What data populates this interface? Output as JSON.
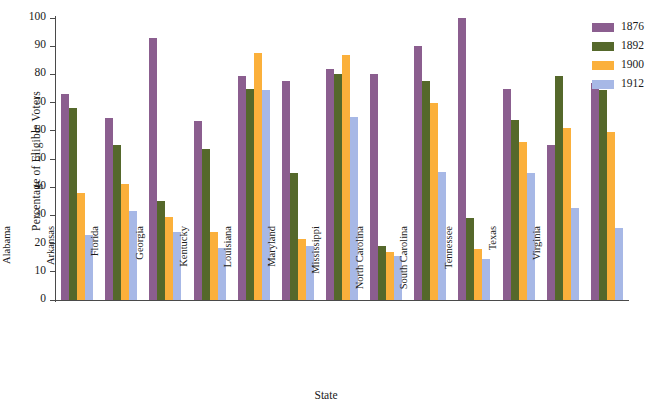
{
  "chart_data": {
    "type": "bar",
    "title": "",
    "xlabel": "State",
    "ylabel": "Percentage of Eligible Voters",
    "ylim": [
      0,
      100
    ],
    "ytick_step": 10,
    "yticks": [
      0,
      10,
      20,
      30,
      40,
      50,
      60,
      70,
      80,
      90,
      100
    ],
    "grid": false,
    "legend_position": "top-right",
    "categories": [
      "Alabama",
      "Arkansas",
      "Florida",
      "Georgia",
      "Kentucky",
      "Louisiana",
      "Maryland",
      "Mississippi",
      "North Carolina",
      "South Carolina",
      "Tennessee",
      "Texas",
      "Virginia"
    ],
    "series": [
      {
        "name": "1876",
        "color": "#8B5E8F",
        "values": [
          73,
          64.5,
          93,
          63.5,
          79.5,
          77.5,
          82,
          80,
          90,
          100,
          75,
          55,
          77
        ]
      },
      {
        "name": "1892",
        "color": "#55682B",
        "values": [
          68,
          55,
          35,
          53.5,
          75,
          45,
          80,
          19,
          77.5,
          29,
          64,
          79.5,
          74.5
        ]
      },
      {
        "name": "1900",
        "color": "#FBB03B",
        "values": [
          38,
          41,
          29.5,
          24,
          87.5,
          21.5,
          87,
          17,
          70,
          18,
          56,
          61,
          59.5
        ]
      },
      {
        "name": "1912",
        "color": "#A7B8E6",
        "values": [
          23,
          31.5,
          24,
          18.5,
          74.5,
          19,
          65,
          15.5,
          45.5,
          14.5,
          45,
          32.5,
          25.5
        ]
      }
    ]
  },
  "legend": {
    "entries": [
      {
        "label": "1876",
        "color": "#8B5E8F"
      },
      {
        "label": "1892",
        "color": "#55682B"
      },
      {
        "label": "1900",
        "color": "#FBB03B"
      },
      {
        "label": "1912",
        "color": "#A7B8E6"
      }
    ]
  },
  "axes": {
    "y_title": "Percentage of Eligible Voters",
    "x_title": "State"
  }
}
